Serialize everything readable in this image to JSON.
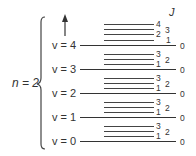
{
  "diagram": {
    "type": "energy-level-diagram",
    "electronic_state_label": "n = 2",
    "rotational_axis_label": "J",
    "arrow": "energy-increasing-up",
    "vibrational_levels": [
      {
        "label": "v = 4",
        "rot_labels": {
          "j4": "4",
          "j3": "3",
          "j2": "2",
          "j1": "1",
          "j0": "0"
        }
      },
      {
        "label": "v = 3",
        "rot_labels": {
          "j3": "3",
          "j2": "2",
          "j1": "1",
          "j0": "0"
        }
      },
      {
        "label": "v = 2",
        "rot_labels": {
          "j3": "3",
          "j2": "2",
          "j1": "1",
          "j0": "0"
        }
      },
      {
        "label": "v = 1",
        "rot_labels": {
          "j3": "3",
          "j2": "2",
          "j1": "1",
          "j0": "0"
        }
      },
      {
        "label": "v = 0",
        "rot_labels": {
          "j3": "3",
          "j2": "2",
          "j1": "1",
          "j0": "0"
        }
      }
    ]
  }
}
